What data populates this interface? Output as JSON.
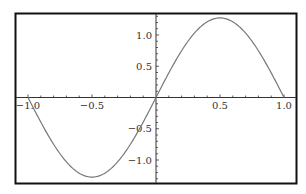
{
  "chart_data": {
    "type": "line",
    "title": "",
    "xlabel": "",
    "ylabel": "",
    "xlim": [
      -1.05,
      1.05
    ],
    "ylim": [
      -1.35,
      1.35
    ],
    "grid": false,
    "legend": null,
    "function": "y = (4/pi) * sin(pi * x)",
    "x_ticks": [
      {
        "value": -1.0,
        "label": "-1.0"
      },
      {
        "value": -0.5,
        "label": "-0.5"
      },
      {
        "value": 0.5,
        "label": "0.5"
      },
      {
        "value": 1.0,
        "label": "1.0"
      }
    ],
    "y_ticks": [
      {
        "value": 1.0,
        "label": "1.0"
      },
      {
        "value": 0.5,
        "label": "0.5"
      },
      {
        "value": -0.5,
        "label": "-0.5"
      },
      {
        "value": -1.0,
        "label": "-1.0"
      }
    ],
    "series": [
      {
        "name": "curve",
        "color": "#777777",
        "x": [
          -1.0,
          -0.75,
          -0.5,
          -0.25,
          0.0,
          0.25,
          0.5,
          0.75,
          1.0
        ],
        "y": [
          0.0,
          -0.9,
          -1.27,
          -0.9,
          0.0,
          0.9,
          1.27,
          0.9,
          0.0
        ]
      }
    ]
  }
}
